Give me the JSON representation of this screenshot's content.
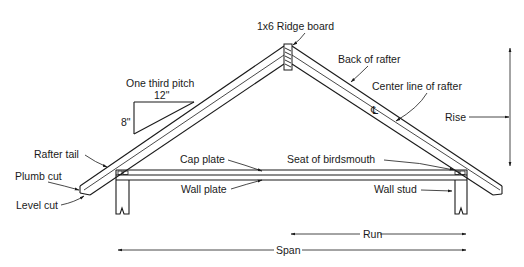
{
  "diagram": {
    "labels": {
      "ridge_board": "1x6 Ridge board",
      "back_of_rafter": "Back of rafter",
      "center_line_of_rafter": "Center line of rafter",
      "center_line_symbol": "℄",
      "rise": "Rise",
      "one_third_pitch": "One third pitch",
      "pitch_run": "12\"",
      "pitch_rise": "8\"",
      "rafter_tail": "Rafter tail",
      "plumb_cut": "Plumb cut",
      "level_cut": "Level cut",
      "cap_plate": "Cap plate",
      "wall_plate": "Wall plate",
      "seat_of_birdsmouth": "Seat of birdsmouth",
      "wall_stud": "Wall stud",
      "run": "Run",
      "span": "Span"
    },
    "colors": {
      "line": "#1a1a1a",
      "background": "#ffffff"
    }
  }
}
